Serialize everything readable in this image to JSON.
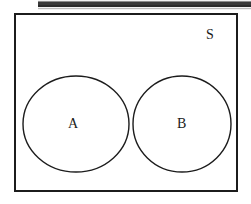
{
  "figure": {
    "kind": "venn-diagram",
    "background_color": "#ffffff",
    "stroke_color": "#1c1c1c",
    "artifact_strip_color": "#3a3a3a"
  },
  "universe": {
    "label": "S",
    "shape": "rectangle"
  },
  "sets": [
    {
      "id": "a",
      "label": "A",
      "shape": "circle",
      "cx": 76,
      "cy": 124,
      "rx": 53,
      "ry": 48
    },
    {
      "id": "b",
      "label": "B",
      "shape": "circle",
      "cx": 182,
      "cy": 124,
      "rx": 49,
      "ry": 48
    }
  ],
  "chart_data": {
    "type": "diagram",
    "title": "",
    "subtype": "venn",
    "relation": "disjoint",
    "universal_set": "S",
    "regions": [
      {
        "name": "A",
        "label": "A",
        "shaded": false
      },
      {
        "name": "B",
        "label": "B",
        "shaded": false
      },
      {
        "name": "A-intersect-B",
        "label": "",
        "shaded": false,
        "empty": true
      },
      {
        "name": "S-complement",
        "label": "S",
        "shaded": false
      }
    ],
    "legend": [],
    "annotations": [
      "A",
      "B",
      "S"
    ]
  }
}
